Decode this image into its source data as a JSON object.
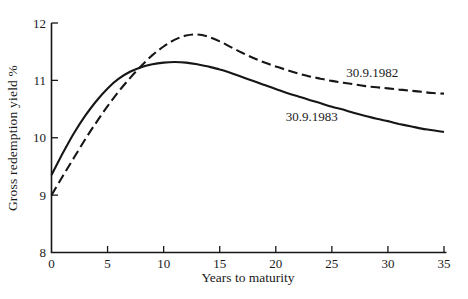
{
  "chart_data": {
    "type": "line",
    "title": "",
    "xlabel": "Years to maturity",
    "ylabel": "Gross redemption yield %",
    "xlim": [
      0,
      35
    ],
    "ylim": [
      8,
      12
    ],
    "x_ticks": [
      0,
      5,
      10,
      15,
      20,
      25,
      30,
      35
    ],
    "y_ticks": [
      8,
      9,
      10,
      11,
      12
    ],
    "grid": false,
    "legend_position": "inline-annotations",
    "categories_x": [
      0,
      1,
      2,
      3,
      4,
      5,
      6,
      7,
      8,
      9,
      10,
      11,
      12,
      13,
      14,
      15,
      16,
      17,
      18,
      19,
      20,
      21,
      22,
      23,
      24,
      25,
      26,
      27,
      28,
      29,
      30,
      31,
      32,
      33,
      34,
      35
    ],
    "series": [
      {
        "name": "30.9.1982",
        "style": "dashed",
        "color": "#161616",
        "values": [
          9.0,
          9.33,
          9.65,
          9.97,
          10.27,
          10.55,
          10.81,
          11.04,
          11.25,
          11.44,
          11.59,
          11.71,
          11.78,
          11.8,
          11.76,
          11.68,
          11.58,
          11.48,
          11.39,
          11.31,
          11.24,
          11.18,
          11.12,
          11.07,
          11.03,
          10.99,
          10.96,
          10.93,
          10.9,
          10.88,
          10.86,
          10.84,
          10.82,
          10.8,
          10.78,
          10.77
        ]
      },
      {
        "name": "30.9.1983",
        "style": "solid",
        "color": "#161616",
        "values": [
          9.35,
          9.73,
          10.08,
          10.38,
          10.64,
          10.86,
          11.03,
          11.15,
          11.23,
          11.28,
          11.31,
          11.32,
          11.31,
          11.28,
          11.24,
          11.19,
          11.13,
          11.06,
          10.99,
          10.92,
          10.85,
          10.78,
          10.72,
          10.66,
          10.6,
          10.54,
          10.49,
          10.43,
          10.38,
          10.33,
          10.29,
          10.24,
          10.2,
          10.16,
          10.13,
          10.1
        ]
      }
    ],
    "annotations": [
      {
        "text": "30.9.1982",
        "x": 28.6,
        "y": 11.12
      },
      {
        "text": "30.9.1983",
        "x": 23.2,
        "y": 10.36
      }
    ]
  },
  "colors": {
    "line": "#161616",
    "text": "#1a1a1a",
    "background": "#ffffff"
  }
}
